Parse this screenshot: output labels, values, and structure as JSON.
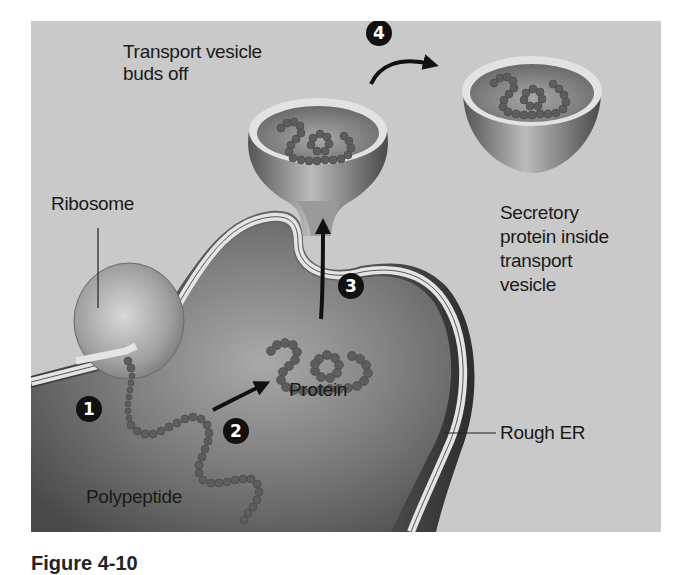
{
  "diagram": {
    "labels": {
      "transport_vesicle_buds": "Transport vesicle\nbuds off",
      "ribosome": "Ribosome",
      "secretory_protein": "Secretory\nprotein inside\ntransport\nvesicle",
      "protein": "Protein",
      "rough_er": "Rough ER",
      "polypeptide": "Polypeptide"
    },
    "steps": [
      {
        "number": "1"
      },
      {
        "number": "2"
      },
      {
        "number": "3"
      },
      {
        "number": "4"
      }
    ],
    "colors": {
      "background": "#c9c9c9",
      "er_lumen": "#6e6e6e",
      "membrane": "#e2e2e2",
      "bead": "#5a5a5a",
      "step_badge": "#111111"
    }
  },
  "caption": {
    "text": "Figure 4-10"
  }
}
